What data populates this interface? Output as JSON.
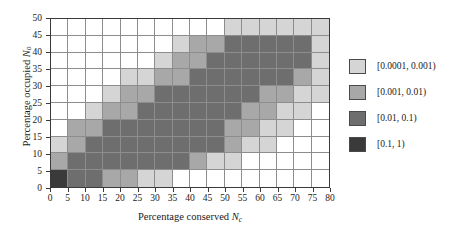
{
  "chart_data": {
    "type": "heatmap",
    "title": "",
    "xlabel": "Percentage conserved",
    "xlabel_symbol": "N",
    "xlabel_subscript": "c",
    "ylabel": "Percentage occupied",
    "ylabel_symbol": "N",
    "ylabel_subscript": "o",
    "xlim": [
      0,
      80
    ],
    "ylim": [
      0,
      50
    ],
    "xticks": [
      0,
      5,
      10,
      15,
      20,
      25,
      30,
      35,
      40,
      45,
      50,
      55,
      60,
      65,
      70,
      75,
      80
    ],
    "yticks": [
      0,
      5,
      10,
      15,
      20,
      25,
      30,
      35,
      40,
      45,
      50
    ],
    "x_bin_edges": [
      0,
      5,
      10,
      15,
      20,
      25,
      30,
      35,
      40,
      45,
      50,
      55,
      60,
      65,
      70,
      75,
      80
    ],
    "y_bin_edges": [
      0,
      5,
      10,
      15,
      20,
      25,
      30,
      35,
      40,
      45,
      50
    ],
    "grid": true,
    "legend_position": "right",
    "bin_levels": [
      {
        "label": "[0.0001, 0.001)",
        "color": "#d5d5d5",
        "level": 1
      },
      {
        "label": "[0.001, 0.01)",
        "color": "#a8a8a8",
        "level": 2
      },
      {
        "label": "[0.01, 0.1)",
        "color": "#6e6e6e",
        "level": 3
      },
      {
        "label": "[0.1, 1)",
        "color": "#3a3a3a",
        "level": 4
      }
    ],
    "empty_color": "#ffffff",
    "level_note": "0 = blank/below 0.0001, 1..4 map to bin_levels",
    "row_labels_bottom_to_top": [
      "0-5",
      "5-10",
      "10-15",
      "15-20",
      "20-25",
      "25-30",
      "30-35",
      "35-40",
      "40-45",
      "45-50"
    ],
    "levels_bottom_to_top": [
      [
        4,
        3,
        3,
        2,
        2,
        1,
        1,
        0,
        0,
        0,
        0,
        0,
        0,
        0,
        0,
        0
      ],
      [
        2,
        3,
        3,
        3,
        3,
        3,
        3,
        3,
        2,
        1,
        1,
        0,
        0,
        0,
        0,
        0
      ],
      [
        1,
        2,
        3,
        3,
        3,
        3,
        3,
        3,
        3,
        3,
        2,
        1,
        1,
        0,
        0,
        0
      ],
      [
        0,
        2,
        2,
        3,
        3,
        3,
        3,
        3,
        3,
        3,
        2,
        2,
        1,
        1,
        0,
        0
      ],
      [
        0,
        0,
        1,
        2,
        2,
        3,
        3,
        3,
        3,
        3,
        3,
        2,
        2,
        1,
        1,
        0
      ],
      [
        0,
        0,
        0,
        1,
        2,
        2,
        3,
        3,
        3,
        3,
        3,
        3,
        2,
        2,
        1,
        1
      ],
      [
        0,
        0,
        0,
        0,
        1,
        1,
        2,
        2,
        3,
        3,
        3,
        3,
        3,
        3,
        2,
        1
      ],
      [
        0,
        0,
        0,
        0,
        0,
        0,
        1,
        2,
        2,
        3,
        3,
        3,
        3,
        3,
        3,
        1
      ],
      [
        0,
        0,
        0,
        0,
        0,
        0,
        0,
        1,
        2,
        2,
        3,
        3,
        3,
        3,
        3,
        1
      ],
      [
        0,
        0,
        0,
        0,
        0,
        0,
        0,
        0,
        0,
        0,
        1,
        1,
        1,
        1,
        1,
        1
      ]
    ]
  }
}
